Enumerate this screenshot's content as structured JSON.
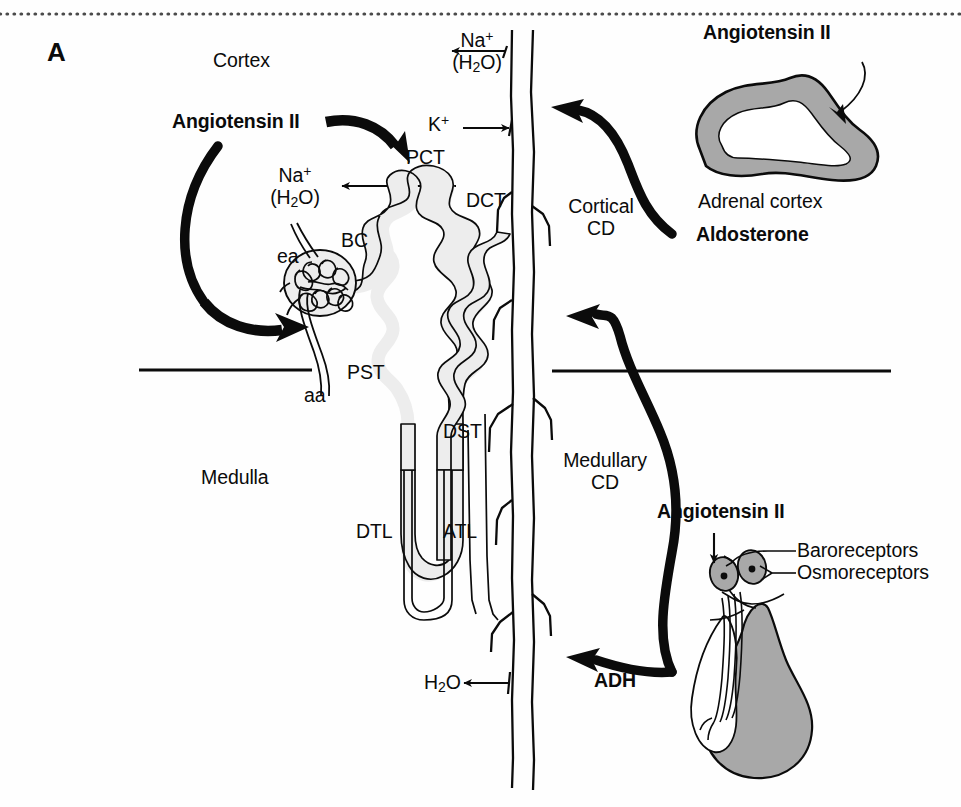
{
  "figure": {
    "panel_letter": "A",
    "title_semantic": "Hormonal regulation of the nephron",
    "background_color": "#fefefe",
    "ink_color": "#0b0b0b",
    "shading_gray": "#a8a8a8",
    "tubule_fill": "#ededed",
    "dotted_rule_color": "#4a4a4a"
  },
  "regions": {
    "cortex": "Cortex",
    "medulla": "Medulla"
  },
  "nephron_labels": {
    "pct": "PCT",
    "pst": "PST",
    "dtl": "DTL",
    "atl": "ATL",
    "dst": "DST",
    "dct": "DCT",
    "bc": "BC",
    "ea": "ea",
    "aa": "aa",
    "cortical_cd_line1": "Cortical",
    "cortical_cd_line2": "CD",
    "medullary_cd_line1": "Medullary",
    "medullary_cd_line2": "CD"
  },
  "transport_labels": {
    "cd_sodium_line1": "Na",
    "cd_sodium_sup": "+",
    "cd_sodium_line2": "(H",
    "cd_sodium_sub": "2",
    "cd_sodium_line2_end": "O)",
    "cd_potassium": "K",
    "cd_potassium_sup": "+",
    "pct_sodium_line1": "Na",
    "pct_sodium_sup": "+",
    "pct_sodium_line2": "(H",
    "pct_sodium_sub": "2",
    "pct_sodium_line2_end": "O)",
    "medullary_water": "H",
    "medullary_water_sub": "2",
    "medullary_water_end": "O"
  },
  "hormones": {
    "angiotensin_ii_left": "Angiotensin II",
    "angiotensin_ii_adrenal": "Angiotensin II",
    "angiotensin_ii_pituitary": "Angiotensin II",
    "aldosterone": "Aldosterone",
    "adh": "ADH"
  },
  "organs": {
    "adrenal_cortex": "Adrenal cortex",
    "baroreceptors": "Baroreceptors",
    "osmoreceptors": "Osmoreceptors"
  }
}
